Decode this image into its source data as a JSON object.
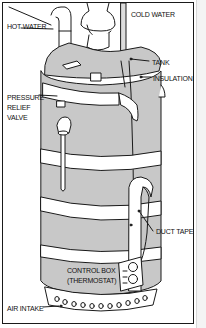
{
  "diagram": {
    "colors": {
      "insulation_fill": "#c8c8c8",
      "tape_fill": "#ffffff",
      "outline": "#1a1a1a",
      "background": "#ffffff"
    },
    "labels": {
      "hot_water": "HOT WATER",
      "cold_water": "COLD WATER",
      "tank": "TANK",
      "insulation": "INSULATION",
      "pressure_relief_valve": [
        "PRESSURE",
        "RELIEF",
        "VALVE"
      ],
      "duct_tape": "DUCT TAPE",
      "control_box": [
        "CONTROL BOX",
        "(THERMOSTAT)"
      ],
      "air_intake": "AIR INTAKE"
    }
  }
}
